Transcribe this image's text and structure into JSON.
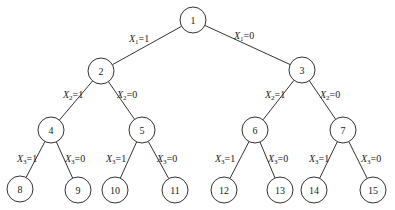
{
  "diagram": {
    "type": "binary-tree",
    "nodes": [
      {
        "id": "1",
        "x": 193,
        "y": 20
      },
      {
        "id": "2",
        "x": 101,
        "y": 71
      },
      {
        "id": "3",
        "x": 302,
        "y": 70
      },
      {
        "id": "4",
        "x": 51,
        "y": 130
      },
      {
        "id": "5",
        "x": 142,
        "y": 130
      },
      {
        "id": "6",
        "x": 255,
        "y": 130
      },
      {
        "id": "7",
        "x": 343,
        "y": 130
      },
      {
        "id": "8",
        "x": 20,
        "y": 189
      },
      {
        "id": "9",
        "x": 78,
        "y": 190
      },
      {
        "id": "10",
        "x": 115,
        "y": 190
      },
      {
        "id": "11",
        "x": 175,
        "y": 190
      },
      {
        "id": "12",
        "x": 224,
        "y": 190
      },
      {
        "id": "13",
        "x": 280,
        "y": 190
      },
      {
        "id": "14",
        "x": 314,
        "y": 190
      },
      {
        "id": "15",
        "x": 373,
        "y": 190
      }
    ],
    "edges": [
      {
        "from": "1",
        "to": "2",
        "var": "X",
        "sub": "1",
        "val": "=1",
        "lx": 129,
        "ly": 42
      },
      {
        "from": "1",
        "to": "3",
        "var": "X",
        "sub": "1",
        "val": "=0",
        "lx": 234,
        "ly": 39
      },
      {
        "from": "2",
        "to": "4",
        "var": "X",
        "sub": "2",
        "val": "=1",
        "lx": 63,
        "ly": 98
      },
      {
        "from": "2",
        "to": "5",
        "var": "X",
        "sub": "2",
        "val": "=0",
        "lx": 117,
        "ly": 98
      },
      {
        "from": "3",
        "to": "6",
        "var": "X",
        "sub": "2",
        "val": "=1",
        "lx": 265,
        "ly": 98
      },
      {
        "from": "3",
        "to": "7",
        "var": "X",
        "sub": "2",
        "val": "=0",
        "lx": 320,
        "ly": 98
      },
      {
        "from": "4",
        "to": "8",
        "var": "X",
        "sub": "3",
        "val": "=1",
        "lx": 17,
        "ly": 162
      },
      {
        "from": "4",
        "to": "9",
        "var": "X",
        "sub": "3",
        "val": "=0",
        "lx": 65,
        "ly": 162
      },
      {
        "from": "5",
        "to": "10",
        "var": "X",
        "sub": "3",
        "val": "=1",
        "lx": 106,
        "ly": 162
      },
      {
        "from": "5",
        "to": "11",
        "var": "X",
        "sub": "3",
        "val": "=0",
        "lx": 157,
        "ly": 162
      },
      {
        "from": "6",
        "to": "12",
        "var": "X",
        "sub": "3",
        "val": "=1",
        "lx": 215,
        "ly": 162
      },
      {
        "from": "6",
        "to": "13",
        "var": "X",
        "sub": "3",
        "val": "=0",
        "lx": 268,
        "ly": 162
      },
      {
        "from": "7",
        "to": "14",
        "var": "X",
        "sub": "3",
        "val": "=1",
        "lx": 309,
        "ly": 162
      },
      {
        "from": "7",
        "to": "15",
        "var": "X",
        "sub": "3",
        "val": "=0",
        "lx": 361,
        "ly": 162
      }
    ],
    "node_radius": 13
  }
}
